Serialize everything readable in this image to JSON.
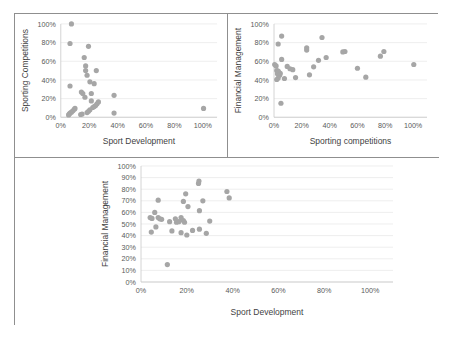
{
  "figure": {
    "panel_border_color": "#8f8f8f",
    "background": "#ffffff",
    "marker_color": "#a6a6a6"
  },
  "chart_data": [
    {
      "id": "chart-sport-dev-vs-sporting-competitions",
      "type": "scatter",
      "title": "",
      "xlabel": "Sport Development",
      "ylabel": "Sporting Competitions",
      "xlim": [
        0,
        1.1
      ],
      "ylim": [
        0,
        1.0
      ],
      "xticks": [
        "0%",
        "20%",
        "40%",
        "60%",
        "80%",
        "100%"
      ],
      "xtick_values": [
        0,
        0.2,
        0.4,
        0.6,
        0.8,
        1.0
      ],
      "yticks": [
        "0%",
        "20%",
        "40%",
        "60%",
        "80%",
        "100%"
      ],
      "ytick_values": [
        0,
        0.2,
        0.4,
        0.6,
        0.8,
        1.0
      ],
      "grid": true,
      "legend": "none",
      "points": [
        [
          0.075,
          1.0
        ],
        [
          0.065,
          0.79
        ],
        [
          0.195,
          0.76
        ],
        [
          0.165,
          0.64
        ],
        [
          0.175,
          0.55
        ],
        [
          0.175,
          0.5
        ],
        [
          0.25,
          0.5
        ],
        [
          0.185,
          0.45
        ],
        [
          0.205,
          0.38
        ],
        [
          0.235,
          0.36
        ],
        [
          0.065,
          0.335
        ],
        [
          0.145,
          0.27
        ],
        [
          0.155,
          0.255
        ],
        [
          0.215,
          0.255
        ],
        [
          0.375,
          0.235
        ],
        [
          0.17,
          0.215
        ],
        [
          0.215,
          0.175
        ],
        [
          0.265,
          0.165
        ],
        [
          0.255,
          0.145
        ],
        [
          0.245,
          0.125
        ],
        [
          0.235,
          0.115
        ],
        [
          0.225,
          0.105
        ],
        [
          0.1,
          0.095
        ],
        [
          1.005,
          0.095
        ],
        [
          0.095,
          0.085
        ],
        [
          0.205,
          0.08
        ],
        [
          0.085,
          0.07
        ],
        [
          0.195,
          0.065
        ],
        [
          0.075,
          0.055
        ],
        [
          0.185,
          0.05
        ],
        [
          0.065,
          0.045
        ],
        [
          0.375,
          0.045
        ],
        [
          0.06,
          0.035
        ],
        [
          0.15,
          0.035
        ],
        [
          0.14,
          0.03
        ],
        [
          0.055,
          0.025
        ]
      ]
    },
    {
      "id": "chart-sporting-competitions-vs-financial-management",
      "type": "scatter",
      "title": "",
      "xlabel": "Sporting competitions",
      "ylabel": "Financial Management",
      "xlim": [
        0,
        1.1
      ],
      "ylim": [
        0,
        1.0
      ],
      "xticks": [
        "0%",
        "20%",
        "40%",
        "60%",
        "80%",
        "100%"
      ],
      "xtick_values": [
        0,
        0.2,
        0.4,
        0.6,
        0.8,
        1.0
      ],
      "yticks": [
        "0%",
        "20%",
        "40%",
        "60%",
        "80%",
        "100%"
      ],
      "ytick_values": [
        0,
        0.2,
        0.4,
        0.6,
        0.8,
        1.0
      ],
      "grid": true,
      "legend": "none",
      "points": [
        [
          0.345,
          0.855
        ],
        [
          0.055,
          0.87
        ],
        [
          0.03,
          0.785
        ],
        [
          0.235,
          0.745
        ],
        [
          0.235,
          0.72
        ],
        [
          0.51,
          0.705
        ],
        [
          0.79,
          0.705
        ],
        [
          0.495,
          0.7
        ],
        [
          0.765,
          0.655
        ],
        [
          0.375,
          0.64
        ],
        [
          0.055,
          0.62
        ],
        [
          0.32,
          0.61
        ],
        [
          0.005,
          0.565
        ],
        [
          1.005,
          0.565
        ],
        [
          0.015,
          0.55
        ],
        [
          0.095,
          0.545
        ],
        [
          0.285,
          0.54
        ],
        [
          0.6,
          0.525
        ],
        [
          0.115,
          0.52
        ],
        [
          0.135,
          0.51
        ],
        [
          0.02,
          0.5
        ],
        [
          0.03,
          0.495
        ],
        [
          0.035,
          0.48
        ],
        [
          0.045,
          0.47
        ],
        [
          0.025,
          0.465
        ],
        [
          0.255,
          0.455
        ],
        [
          0.04,
          0.45
        ],
        [
          0.66,
          0.43
        ],
        [
          0.155,
          0.425
        ],
        [
          0.03,
          0.42
        ],
        [
          0.075,
          0.415
        ],
        [
          0.02,
          0.405
        ],
        [
          0.05,
          0.15
        ]
      ]
    },
    {
      "id": "chart-sport-dev-vs-financial-management",
      "type": "scatter",
      "title": "",
      "xlabel": "Sport Development",
      "ylabel": "Financial Management",
      "xlim": [
        0,
        1.1
      ],
      "ylim": [
        0,
        1.0
      ],
      "xticks": [
        "0%",
        "20%",
        "40%",
        "60%",
        "80%",
        "100%"
      ],
      "xtick_values": [
        0,
        0.2,
        0.4,
        0.6,
        0.8,
        1.0
      ],
      "yticks": [
        "0%",
        "10%",
        "20%",
        "30%",
        "40%",
        "50%",
        "60%",
        "70%",
        "80%",
        "90%",
        "100%"
      ],
      "ytick_values": [
        0,
        0.1,
        0.2,
        0.3,
        0.4,
        0.5,
        0.6,
        0.7,
        0.8,
        0.9,
        1.0
      ],
      "grid": true,
      "legend": "none",
      "points": [
        [
          0.253,
          0.87
        ],
        [
          0.251,
          0.85
        ],
        [
          0.375,
          0.78
        ],
        [
          0.385,
          0.725
        ],
        [
          0.195,
          0.76
        ],
        [
          0.075,
          0.705
        ],
        [
          0.185,
          0.695
        ],
        [
          0.27,
          0.7
        ],
        [
          0.205,
          0.65
        ],
        [
          0.255,
          0.615
        ],
        [
          0.06,
          0.6
        ],
        [
          0.04,
          0.555
        ],
        [
          0.048,
          0.548
        ],
        [
          0.075,
          0.555
        ],
        [
          0.082,
          0.545
        ],
        [
          0.09,
          0.54
        ],
        [
          0.125,
          0.52
        ],
        [
          0.15,
          0.545
        ],
        [
          0.175,
          0.555
        ],
        [
          0.185,
          0.53
        ],
        [
          0.19,
          0.515
        ],
        [
          0.155,
          0.515
        ],
        [
          0.165,
          0.52
        ],
        [
          0.3,
          0.525
        ],
        [
          0.065,
          0.475
        ],
        [
          0.255,
          0.455
        ],
        [
          0.045,
          0.43
        ],
        [
          0.135,
          0.44
        ],
        [
          0.175,
          0.425
        ],
        [
          0.2,
          0.405
        ],
        [
          0.285,
          0.42
        ],
        [
          0.225,
          0.445
        ],
        [
          0.115,
          0.15
        ]
      ]
    }
  ]
}
